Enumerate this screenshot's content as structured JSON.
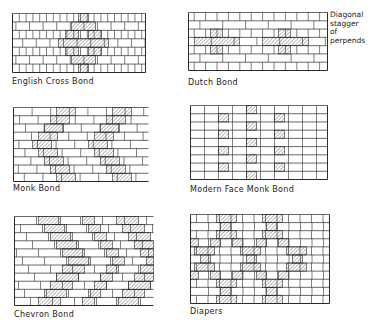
{
  "page": {
    "background": "#ffffff",
    "line_color": "#2a2a2a",
    "hatch_color": "#3a3a3a"
  },
  "annotation": {
    "lines": [
      "Diagonal",
      "stagger",
      "of perpends"
    ]
  },
  "panels": [
    {
      "id": "english-cross",
      "caption": "English Cross Bond",
      "x": 12,
      "y": 13,
      "w": 133,
      "h": 59,
      "caption_x": 12,
      "caption_y": 77,
      "rows": 7,
      "right_border": true,
      "pattern": "english-cross",
      "hatched": [
        {
          "r": 0,
          "x0": 66,
          "x1": 76
        },
        {
          "r": 1,
          "x0": 59,
          "x1": 83
        },
        {
          "r": 2,
          "x0": 53,
          "x1": 66
        },
        {
          "r": 2,
          "x0": 76,
          "x1": 89
        },
        {
          "r": 3,
          "x0": 46,
          "x1": 96
        },
        {
          "r": 4,
          "x0": 53,
          "x1": 66
        },
        {
          "r": 4,
          "x0": 76,
          "x1": 89
        },
        {
          "r": 5,
          "x0": 59,
          "x1": 83
        },
        {
          "r": 6,
          "x0": 66,
          "x1": 76
        }
      ]
    },
    {
      "id": "dutch",
      "caption": "Dutch Bond",
      "x": 188,
      "y": 12,
      "w": 139,
      "h": 58,
      "caption_x": 188,
      "caption_y": 78,
      "rows": 7,
      "right_border": true,
      "pattern": "dutch",
      "hatched": [
        {
          "r": 2,
          "x0": 22,
          "x1": 34
        },
        {
          "r": 3,
          "x0": 6,
          "x1": 51
        },
        {
          "r": 4,
          "x0": 22,
          "x1": 34
        },
        {
          "r": 2,
          "x0": 90,
          "x1": 102
        },
        {
          "r": 3,
          "x0": 74,
          "x1": 120
        },
        {
          "r": 4,
          "x0": 90,
          "x1": 102
        }
      ]
    },
    {
      "id": "monk",
      "caption": "Monk Bond",
      "x": 13,
      "y": 107,
      "w": 135,
      "h": 74,
      "caption_x": 13,
      "caption_y": 184,
      "rows": 9,
      "right_border": false,
      "pattern": "monk",
      "hatched": [
        {
          "r": 0,
          "x0": 43,
          "x1": 62
        },
        {
          "r": 0,
          "x0": 99,
          "x1": 118
        },
        {
          "r": 1,
          "x0": 37,
          "x1": 56
        },
        {
          "r": 1,
          "x0": 93,
          "x1": 112
        },
        {
          "r": 2,
          "x0": 31,
          "x1": 50
        },
        {
          "r": 2,
          "x0": 87,
          "x1": 106
        },
        {
          "r": 3,
          "x0": 25,
          "x1": 44
        },
        {
          "r": 3,
          "x0": 81,
          "x1": 100
        },
        {
          "r": 4,
          "x0": 19,
          "x1": 38
        },
        {
          "r": 4,
          "x0": 75,
          "x1": 94
        },
        {
          "r": 5,
          "x0": 25,
          "x1": 44
        },
        {
          "r": 5,
          "x0": 81,
          "x1": 100
        },
        {
          "r": 6,
          "x0": 31,
          "x1": 50
        },
        {
          "r": 6,
          "x0": 87,
          "x1": 106
        },
        {
          "r": 7,
          "x0": 37,
          "x1": 56
        },
        {
          "r": 7,
          "x0": 93,
          "x1": 112
        },
        {
          "r": 8,
          "x0": 43,
          "x1": 62
        },
        {
          "r": 8,
          "x0": 99,
          "x1": 118
        }
      ]
    },
    {
      "id": "modern-face-monk",
      "caption": "Modern Face Monk Bond",
      "x": 190,
      "y": 105,
      "w": 137,
      "h": 74,
      "caption_x": 190,
      "caption_y": 185,
      "rows": 9,
      "right_border": true,
      "pattern": "modern-monk",
      "hatched": [
        {
          "r": 0,
          "x0": 56,
          "x1": 66
        },
        {
          "r": 1,
          "x0": 28,
          "x1": 38
        },
        {
          "r": 1,
          "x0": 84,
          "x1": 94
        },
        {
          "r": 2,
          "x0": 56,
          "x1": 66
        },
        {
          "r": 3,
          "x0": 28,
          "x1": 38
        },
        {
          "r": 3,
          "x0": 84,
          "x1": 94
        },
        {
          "r": 4,
          "x0": 56,
          "x1": 66
        },
        {
          "r": 5,
          "x0": 28,
          "x1": 38
        },
        {
          "r": 5,
          "x0": 84,
          "x1": 94
        },
        {
          "r": 6,
          "x0": 56,
          "x1": 66
        },
        {
          "r": 7,
          "x0": 28,
          "x1": 38
        },
        {
          "r": 7,
          "x0": 84,
          "x1": 94
        },
        {
          "r": 8,
          "x0": 56,
          "x1": 66
        }
      ]
    },
    {
      "id": "chevron",
      "caption": "Chevron Bond",
      "x": 14,
      "y": 216,
      "w": 139,
      "h": 89,
      "caption_x": 14,
      "caption_y": 310,
      "rows": 11,
      "right_border": false,
      "pattern": "chevron",
      "hatched": [
        {
          "r": 0,
          "x0": 24,
          "x1": 46
        },
        {
          "r": 0,
          "x0": 68,
          "x1": 80
        },
        {
          "r": 0,
          "x0": 102,
          "x1": 124
        },
        {
          "r": 1,
          "x0": 30,
          "x1": 52
        },
        {
          "r": 1,
          "x0": 74,
          "x1": 86
        },
        {
          "r": 1,
          "x0": 108,
          "x1": 130
        },
        {
          "r": 2,
          "x0": 36,
          "x1": 58
        },
        {
          "r": 2,
          "x0": 80,
          "x1": 92
        },
        {
          "r": 2,
          "x0": 114,
          "x1": 136
        },
        {
          "r": 3,
          "x0": 42,
          "x1": 64
        },
        {
          "r": 3,
          "x0": 86,
          "x1": 98
        },
        {
          "r": 3,
          "x0": 120,
          "x1": 139
        },
        {
          "r": 4,
          "x0": 48,
          "x1": 70
        },
        {
          "r": 4,
          "x0": 92,
          "x1": 104
        },
        {
          "r": 4,
          "x0": 126,
          "x1": 139
        },
        {
          "r": 5,
          "x0": 54,
          "x1": 76
        },
        {
          "r": 5,
          "x0": 98,
          "x1": 110
        },
        {
          "r": 5,
          "x0": 132,
          "x1": 139
        },
        {
          "r": 6,
          "x0": 48,
          "x1": 70
        },
        {
          "r": 6,
          "x0": 92,
          "x1": 104
        },
        {
          "r": 6,
          "x0": 126,
          "x1": 139
        },
        {
          "r": 7,
          "x0": 42,
          "x1": 64
        },
        {
          "r": 7,
          "x0": 86,
          "x1": 98
        },
        {
          "r": 7,
          "x0": 120,
          "x1": 139
        },
        {
          "r": 8,
          "x0": 36,
          "x1": 58
        },
        {
          "r": 8,
          "x0": 80,
          "x1": 92
        },
        {
          "r": 8,
          "x0": 114,
          "x1": 136
        },
        {
          "r": 9,
          "x0": 30,
          "x1": 52
        },
        {
          "r": 9,
          "x0": 74,
          "x1": 86
        },
        {
          "r": 9,
          "x0": 108,
          "x1": 130
        },
        {
          "r": 10,
          "x0": 24,
          "x1": 46
        },
        {
          "r": 10,
          "x0": 68,
          "x1": 80
        },
        {
          "r": 10,
          "x0": 102,
          "x1": 124
        }
      ]
    },
    {
      "id": "diapers",
      "caption": "Diapers",
      "x": 190,
      "y": 214,
      "w": 139,
      "h": 89,
      "caption_x": 190,
      "caption_y": 307,
      "rows": 11,
      "right_border": true,
      "pattern": "diapers",
      "hatched": [
        {
          "r": 0,
          "x0": 26,
          "x1": 46
        },
        {
          "r": 0,
          "x0": 72,
          "x1": 92
        },
        {
          "r": 1,
          "x0": 30,
          "x1": 40
        },
        {
          "r": 1,
          "x0": 76,
          "x1": 86
        },
        {
          "r": 2,
          "x0": 26,
          "x1": 46
        },
        {
          "r": 2,
          "x0": 72,
          "x1": 92
        },
        {
          "r": 3,
          "x0": 0,
          "x1": 8
        },
        {
          "r": 3,
          "x0": 20,
          "x1": 30
        },
        {
          "r": 3,
          "x0": 42,
          "x1": 52
        },
        {
          "r": 3,
          "x0": 66,
          "x1": 76
        },
        {
          "r": 3,
          "x0": 88,
          "x1": 98
        },
        {
          "r": 4,
          "x0": 4,
          "x1": 24
        },
        {
          "r": 4,
          "x0": 50,
          "x1": 70
        },
        {
          "r": 4,
          "x0": 96,
          "x1": 116
        },
        {
          "r": 5,
          "x0": 10,
          "x1": 20
        },
        {
          "r": 5,
          "x0": 56,
          "x1": 66
        },
        {
          "r": 5,
          "x0": 102,
          "x1": 112
        },
        {
          "r": 6,
          "x0": 4,
          "x1": 24
        },
        {
          "r": 6,
          "x0": 50,
          "x1": 70
        },
        {
          "r": 6,
          "x0": 96,
          "x1": 116
        },
        {
          "r": 7,
          "x0": 0,
          "x1": 8
        },
        {
          "r": 7,
          "x0": 20,
          "x1": 30
        },
        {
          "r": 7,
          "x0": 42,
          "x1": 52
        },
        {
          "r": 7,
          "x0": 66,
          "x1": 76
        },
        {
          "r": 7,
          "x0": 88,
          "x1": 98
        },
        {
          "r": 8,
          "x0": 26,
          "x1": 46
        },
        {
          "r": 8,
          "x0": 72,
          "x1": 92
        },
        {
          "r": 9,
          "x0": 30,
          "x1": 40
        },
        {
          "r": 9,
          "x0": 76,
          "x1": 86
        },
        {
          "r": 10,
          "x0": 26,
          "x1": 46
        },
        {
          "r": 10,
          "x0": 72,
          "x1": 92
        }
      ]
    }
  ]
}
